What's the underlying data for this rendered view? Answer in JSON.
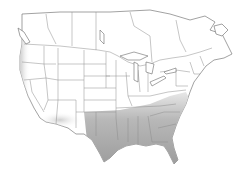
{
  "map": {
    "type": "species-range-map",
    "region": "North America (United States and southern Canada)",
    "style": "grayscale",
    "colors": {
      "background": "#ffffff",
      "land": "#ffffff",
      "borders": "#7a7a7a",
      "range_shading_dark": "#9a9a9a",
      "range_shading_light": "#d8d8d8"
    },
    "shaded_regions": [
      {
        "name": "gulf-southeast",
        "description": "Southeastern US and Gulf Coast incl. Texas, Louisiana, Mississippi, Alabama, Georgia, Florida, Carolinas",
        "intensity": "dark"
      },
      {
        "name": "pacific-coast",
        "description": "Pacific coast from Washington to southern California",
        "intensity": "light"
      },
      {
        "name": "southwest",
        "description": "Southern Arizona / New Mexico border region",
        "intensity": "light"
      }
    ]
  }
}
